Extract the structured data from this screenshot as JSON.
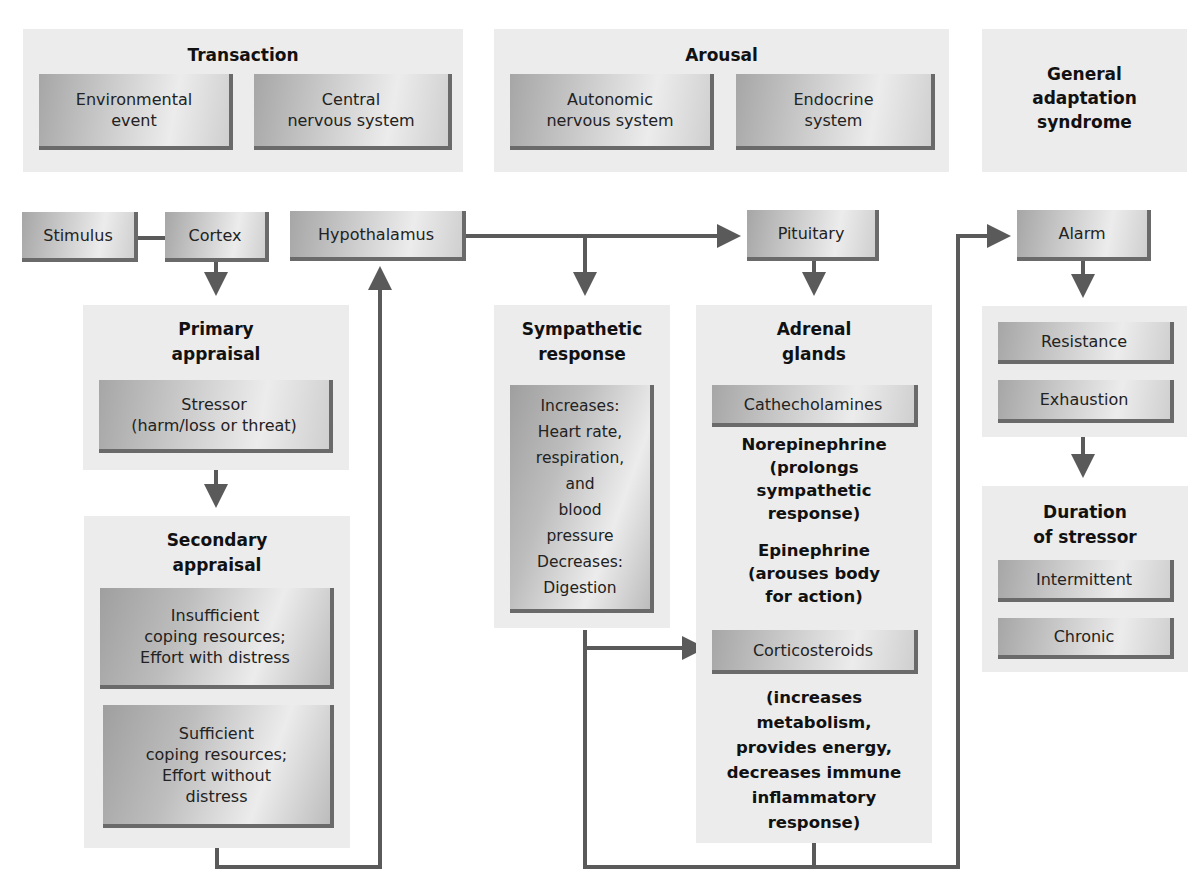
{
  "header_panels": {
    "transaction": {
      "title": "Transaction",
      "boxes": [
        "Environmental\nevent",
        "Central\nnervous system"
      ]
    },
    "arousal": {
      "title": "Arousal",
      "boxes": [
        "Autonomic\nnervous system",
        "Endocrine\nsystem"
      ]
    },
    "gas": {
      "title": "General\nadaptation\nsyndrome"
    }
  },
  "nodes": {
    "stimulus": "Stimulus",
    "cortex": "Cortex",
    "hypothalamus": "Hypothalamus",
    "pituitary": "Pituitary",
    "alarm": "Alarm"
  },
  "primary_appraisal": {
    "title": "Primary\nappraisal",
    "box": "Stressor\n(harm/loss or threat)"
  },
  "secondary_appraisal": {
    "title": "Secondary\nappraisal",
    "boxes": [
      "Insufficient\ncoping resources;\nEffort with distress",
      "Sufficient\ncoping resources;\nEffort without\ndistress"
    ]
  },
  "sympathetic_response": {
    "title": "Sympathetic\nresponse",
    "box": "Increases:\nHeart rate,\nrespiration,\nand\nblood\npressure\nDecreases:\nDigestion"
  },
  "adrenal_glands": {
    "title": "Adrenal\nglands",
    "cathecholamines": "Cathecholamines",
    "norepinephrine": "Norepinephrine\n(prolongs\nsympathetic\nresponse)",
    "epinephrine": "Epinephrine\n(arouses body\nfor action)",
    "corticosteroids": "Corticosteroids",
    "corticosteroids_effect": "(increases\nmetabolism,\nprovides energy,\ndecreases immune\ninflammatory\nresponse)"
  },
  "stages": {
    "resistance": "Resistance",
    "exhaustion": "Exhaustion"
  },
  "duration": {
    "title": "Duration\nof stressor",
    "intermittent": "Intermittent",
    "chronic": "Chronic"
  },
  "colors": {
    "panel_bg": "#ececec",
    "box_shadow_edge": "#6a6a6a",
    "connector": "#5a5a5a"
  }
}
